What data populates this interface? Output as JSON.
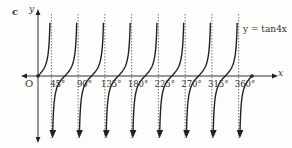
{
  "figure": {
    "panel_label": "c",
    "curve_label": "y = tan4x",
    "x_axis_label": "x",
    "y_axis_label": "y",
    "origin_label": "O"
  },
  "chart_data": {
    "type": "line",
    "title": "",
    "function": "y = tan(4x)",
    "xlabel": "x",
    "ylabel": "y",
    "x_ticks": [
      "45°",
      "90°",
      "135°",
      "180°",
      "225°",
      "270°",
      "315°",
      "360°"
    ],
    "x_tick_values": [
      45,
      90,
      135,
      180,
      225,
      270,
      315,
      360
    ],
    "xlim": [
      0,
      360
    ],
    "period_degrees": 45,
    "vertical_asymptotes": [
      22.5,
      67.5,
      112.5,
      157.5,
      202.5,
      247.5,
      292.5,
      337.5
    ],
    "zeros": [
      0,
      45,
      90,
      135,
      180,
      225,
      270,
      315,
      360
    ],
    "grid": false,
    "legend": null,
    "annotations": [
      "y = tan4x",
      "O"
    ]
  },
  "colors": {
    "curve": "#222222",
    "axis": "#333333",
    "asymptote": "#666666",
    "background": "#fdfdfc"
  }
}
